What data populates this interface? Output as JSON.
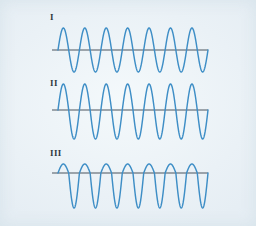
{
  "figure": {
    "background_color": "#edf4f8",
    "wave_color": "#3e8ec6",
    "axis_color": "#4a555f",
    "width": 256,
    "height": 226
  },
  "labels": {
    "wave_one": "I",
    "wave_two": "II",
    "wave_three": "III"
  },
  "chart_data": {
    "type": "line",
    "title": "",
    "xlabel": "",
    "ylabel": "",
    "grid": false,
    "legend": "none",
    "x_start_px": 52,
    "x_end_px": 208,
    "series": [
      {
        "name": "I",
        "label": "I",
        "axis_y_px": 50,
        "wave_start_x_px": 58,
        "wave_end_x_px": 208,
        "cycles": 7,
        "amplitude_up_px": 22,
        "amplitude_down_px": 22,
        "offset_px": 0,
        "symmetric": true,
        "phase": "starts at zero rising",
        "color": "#3e8ec6"
      },
      {
        "name": "II",
        "label": "II",
        "axis_y_px": 110,
        "wave_start_x_px": 58,
        "wave_end_x_px": 208,
        "cycles": 7,
        "amplitude_up_px": 26,
        "amplitude_down_px": 29,
        "offset_px": -2,
        "symmetric": true,
        "phase": "starts at zero rising",
        "color": "#3e8ec6"
      },
      {
        "name": "III",
        "label": "III",
        "axis_y_px": 173,
        "wave_start_x_px": 58,
        "wave_end_x_px": 208,
        "cycles": 7,
        "amplitude_up_px": 9,
        "amplitude_down_px": 35,
        "offset_px": -13,
        "symmetric": false,
        "phase": "starts at zero rising, negatively offset",
        "color": "#3e8ec6"
      }
    ]
  }
}
